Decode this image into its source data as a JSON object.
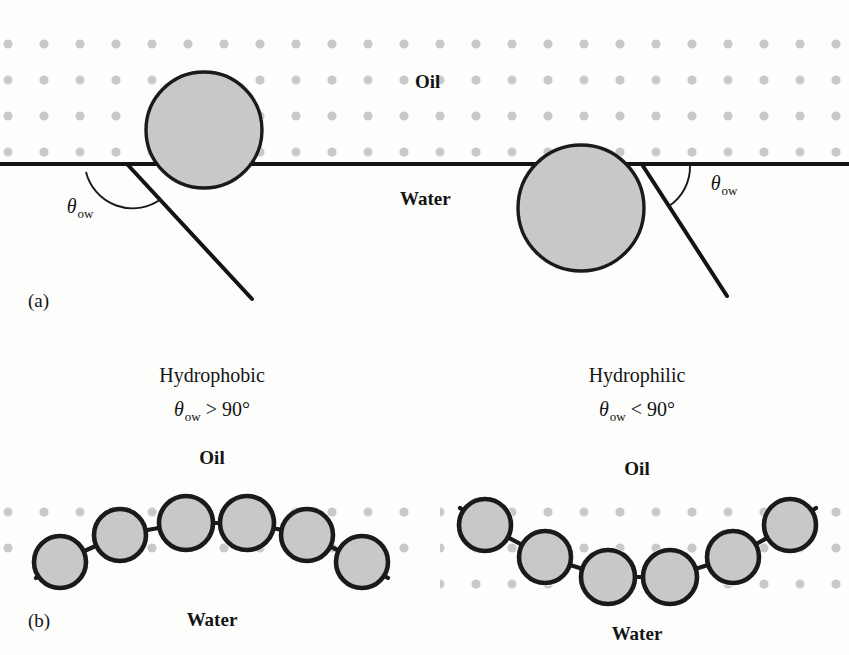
{
  "figure": {
    "panels": [
      {
        "tag": "(a)",
        "phase_top_label": "Oil",
        "phase_bottom_label": "Water",
        "angle_label_symbol": "θ",
        "angle_label_subscript": "ow",
        "particles": [
          {
            "name": "hydrophobic-particle",
            "cx": 204,
            "cy": 130,
            "r": 58,
            "contact_x": 127,
            "contact_y": 164,
            "tangent_end_x": 250,
            "tangent_end_y": 297
          },
          {
            "name": "hydrophilic-particle",
            "cx": 581,
            "cy": 208,
            "r": 63,
            "contact_x": 643,
            "contact_y": 166,
            "tangent_end_x": 724,
            "tangent_end_y": 293
          }
        ],
        "interface_y": 164
      },
      {
        "tag": "(b)",
        "subpanels": [
          {
            "name": "hydrophobic-monolayer",
            "heading": "Hydrophobic",
            "condition_symbol": "θ",
            "condition_subscript": "ow",
            "condition_relation": "> 90°",
            "phase_top_label": "Oil",
            "phase_bottom_label": "Water",
            "curvature": "convex",
            "particles": [
              {
                "cx": 60,
                "cy": 562,
                "r": 26
              },
              {
                "cx": 120,
                "cy": 535,
                "r": 26
              },
              {
                "cx": 186,
                "cy": 523,
                "r": 27
              },
              {
                "cx": 247,
                "cy": 523,
                "r": 27
              },
              {
                "cx": 307,
                "cy": 535,
                "r": 26
              },
              {
                "cx": 362,
                "cy": 562,
                "r": 26
              }
            ]
          },
          {
            "name": "hydrophilic-monolayer",
            "heading": "Hydrophilic",
            "condition_symbol": "θ",
            "condition_subscript": "ow",
            "condition_relation": "< 90°",
            "phase_top_label": "Oil",
            "phase_bottom_label": "Water",
            "curvature": "concave",
            "particles": [
              {
                "cx": 485,
                "cy": 525,
                "r": 26
              },
              {
                "cx": 545,
                "cy": 557,
                "r": 26
              },
              {
                "cx": 608,
                "cy": 577,
                "r": 27
              },
              {
                "cx": 670,
                "cy": 577,
                "r": 27
              },
              {
                "cx": 733,
                "cy": 557,
                "r": 26
              },
              {
                "cx": 790,
                "cy": 525,
                "r": 26
              }
            ]
          }
        ]
      }
    ],
    "colors": {
      "particle_fill": "#c8c8c8",
      "particle_stroke": "#1a1a1a",
      "oil_dot": "#c9c9c9",
      "interface_line": "#141414",
      "background": "#fdfdfc"
    },
    "labels": {
      "panel_a_tag": "(a)",
      "panel_b_tag": "(b)",
      "oil": "Oil",
      "water": "Water",
      "theta": "θ",
      "ow": "ow",
      "hydrophobic": "Hydrophobic",
      "hydrophilic": "Hydrophilic",
      "gt90": "> 90°",
      "lt90": "< 90°"
    }
  }
}
